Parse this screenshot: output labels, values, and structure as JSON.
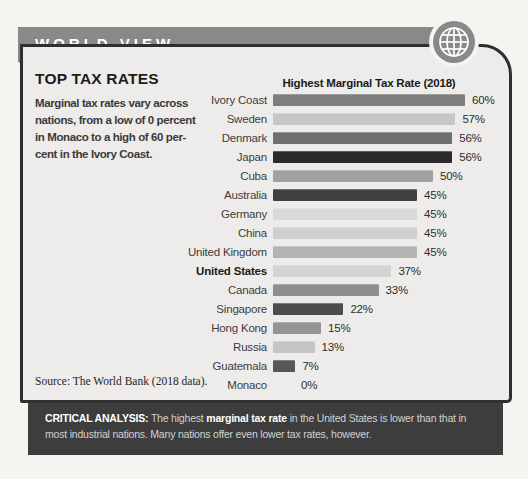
{
  "header": {
    "title": "WORLD VIEW",
    "bar_color": "#898989",
    "icon": "globe"
  },
  "panel": {
    "heading": "TOP TAX RATES",
    "description_lines": [
      "Marginal tax rates vary across",
      "nations, from a low of 0 percent",
      "in Monaco to a high of 60 per-",
      "cent in the Ivory Coast."
    ],
    "source": "Source: The World Bank (2018 data).",
    "bg_color": "#edecea",
    "border_color": "#2f2f2f"
  },
  "chart_data": {
    "type": "bar",
    "orientation": "horizontal",
    "title": "Highest Marginal Tax Rate (2018)",
    "unit": "%",
    "xlim": [
      0,
      60
    ],
    "gridlines": false,
    "value_labels_shown": true,
    "emphasized_category": "United States",
    "categories": [
      "Ivory Coast",
      "Sweden",
      "Denmark",
      "Japan",
      "Cuba",
      "Australia",
      "Germany",
      "China",
      "United Kingdom",
      "United States",
      "Canada",
      "Singapore",
      "Hong Kong",
      "Russia",
      "Guatemala",
      "Monaco"
    ],
    "values": [
      60,
      57,
      56,
      56,
      50,
      45,
      45,
      45,
      45,
      37,
      33,
      22,
      15,
      13,
      7,
      0
    ],
    "value_labels": [
      "60%",
      "57%",
      "56%",
      "56%",
      "50%",
      "45%",
      "45%",
      "45%",
      "45%",
      "37%",
      "33%",
      "22%",
      "15%",
      "13%",
      "7%",
      "0%"
    ],
    "bar_colors": [
      "#7d7d7d",
      "#c6c6c6",
      "#6f6f6f",
      "#2a2a2a",
      "#a1a1a1",
      "#414141",
      "#d9d9d9",
      "#cfcfcf",
      "#b3b3b3",
      "#d4d4d4",
      "#8f8f8f",
      "#4d4d4d",
      "#949494",
      "#c5c5c5",
      "#575757",
      null
    ]
  },
  "footer": {
    "bg_color": "#3d3d3d",
    "segments": [
      {
        "text": "CRITICAL ANALYSIS:",
        "bold": true
      },
      {
        "text": " The highest ",
        "bold": false
      },
      {
        "text": "marginal tax rate",
        "bold": true
      },
      {
        "text": " in the United States is lower than that in most industrial nations. Many nations offer even lower tax rates, however.",
        "bold": false
      }
    ]
  }
}
